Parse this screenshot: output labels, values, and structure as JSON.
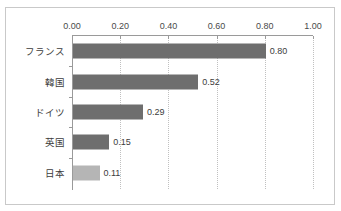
{
  "clipped_header_text": "",
  "chart_data": {
    "type": "bar",
    "orientation": "horizontal",
    "title": "",
    "subtitle": "",
    "xlabel": "",
    "ylabel": "",
    "categories": [
      "フランス",
      "韓国",
      "ドイツ",
      "英国",
      "日本"
    ],
    "values": [
      0.8,
      0.52,
      0.29,
      0.15,
      0.11
    ],
    "value_labels": [
      "0.80",
      "0.52",
      "0.29",
      "0.15",
      "0.11"
    ],
    "xlim": [
      0.0,
      1.0
    ],
    "xticks": [
      0.0,
      0.2,
      0.4,
      0.6,
      0.8,
      1.0
    ],
    "xtick_labels": [
      "0.00",
      "0.20",
      "0.40",
      "0.60",
      "0.80",
      "1.00"
    ],
    "grid": "vertical-dotted",
    "legend": "none",
    "axis_position": "top",
    "bar_colors": [
      "#6e6e6e",
      "#6e6e6e",
      "#6e6e6e",
      "#6e6e6e",
      "#b5b5b5"
    ],
    "highlight_category": "日本",
    "colors": {
      "bar_default": "#6e6e6e",
      "bar_highlight": "#b5b5b5",
      "gridline": "#c0c0c0",
      "axis": "#9a9a9a",
      "frame_border": "#c9c9c9",
      "text": "#3c3c3c",
      "tick_text": "#4a4a4a",
      "background": "#ffffff"
    }
  }
}
